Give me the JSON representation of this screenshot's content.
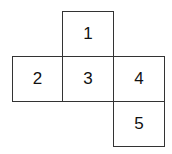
{
  "diagram": {
    "type": "cube-net",
    "cells": [
      {
        "label": "1",
        "row": 0,
        "col": 1
      },
      {
        "label": "2",
        "row": 1,
        "col": 0
      },
      {
        "label": "3",
        "row": 1,
        "col": 1
      },
      {
        "label": "4",
        "row": 1,
        "col": 2
      },
      {
        "label": "5",
        "row": 2,
        "col": 2
      }
    ]
  }
}
